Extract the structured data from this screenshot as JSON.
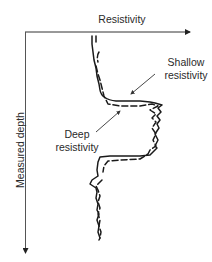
{
  "diagram": {
    "x_axis": {
      "label": "Resistivity"
    },
    "y_axis": {
      "label": "Measured depth"
    },
    "annotations": {
      "shallow": {
        "line1": "Shallow",
        "line2": "resistivity"
      },
      "deep": {
        "line1": "Deep",
        "line2": "resistivity"
      }
    },
    "legend_styles": {
      "shallow_resistivity": "dashed",
      "deep_resistivity": "solid"
    },
    "colors": {
      "line": "#222222",
      "background": "#ffffff"
    }
  }
}
